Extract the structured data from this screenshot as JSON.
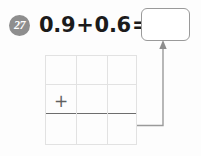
{
  "problem": {
    "number": "27",
    "equation": {
      "first_addend": "0.9",
      "operator": "+",
      "second_addend": "0.6",
      "equals": "="
    },
    "answer_box": {
      "value": "",
      "placeholder": ""
    },
    "grid": {
      "columns": 3,
      "rows": 3,
      "operator_cell": "+",
      "sum_line_row": 2,
      "cells": [
        [
          "",
          "",
          ""
        ],
        [
          "+",
          "",
          ""
        ],
        [
          "",
          "",
          ""
        ]
      ]
    },
    "connector": {
      "label": "arrow-from-grid-to-answer-box",
      "direction": "up"
    }
  },
  "colors": {
    "badge_fill": "#8e8e8e",
    "badge_text": "#ffffff",
    "text": "#1b1b1b",
    "grid_line": "#e2e2e2",
    "sum_line": "#6d6d6d",
    "box_border": "#9a9a9a",
    "connector": "#9a9a9a"
  }
}
